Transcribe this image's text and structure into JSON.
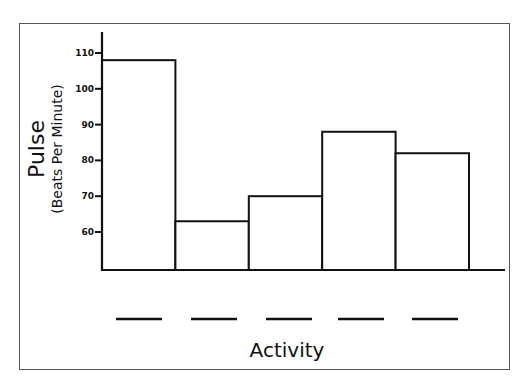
{
  "chart_data": {
    "type": "bar",
    "title": "",
    "xlabel": "Activity",
    "ylabel": "Pulse",
    "ylabel_sub": "(Beats Per Minute)",
    "categories": [
      "",
      "",
      "",
      "",
      ""
    ],
    "category_note": "Category labels are blank lines to be filled in",
    "values": [
      108,
      63,
      70,
      88,
      82
    ],
    "yticks": [
      60,
      70,
      80,
      90,
      100,
      110
    ],
    "ylim": [
      50,
      115
    ],
    "grid": false,
    "legend": null
  },
  "axis": {
    "ylabel_main": "Pulse",
    "ylabel_sub": "(Beats Per Minute)",
    "xlabel": "Activity",
    "tick_labels": [
      "110",
      "100",
      "90",
      "80",
      "70",
      "60"
    ]
  },
  "colors": {
    "stroke": "#111111",
    "bar_fill": "#ffffff",
    "frame": "#555555"
  }
}
